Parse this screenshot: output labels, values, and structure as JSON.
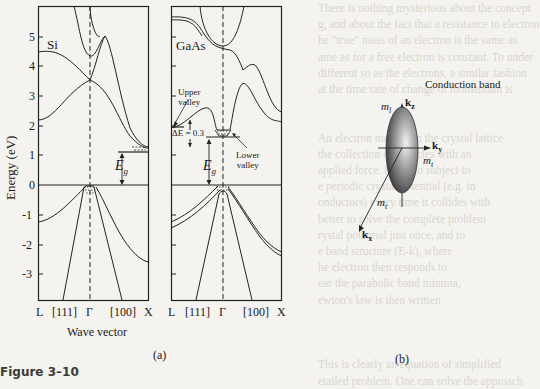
{
  "figure": {
    "caption": "Figure 3–10",
    "panel_a_label": "(a)",
    "panel_b_label": "(b)"
  },
  "panel_a": {
    "y_axis_label": "Energy (eV)",
    "x_axis_label": "Wave vector",
    "y_ticks": [
      "5",
      "4",
      "3",
      "2",
      "1",
      "0",
      "-1",
      "-2",
      "-3"
    ],
    "si": {
      "title": "Si",
      "x_ticks": [
        "L",
        "[111]",
        "Γ",
        "[100]",
        "X"
      ],
      "gap_label": "E",
      "gap_sub": "g"
    },
    "gaas": {
      "title": "GaAs",
      "x_ticks": [
        "L",
        "[111]",
        "Γ",
        "[100]",
        "X"
      ],
      "upper_valley": [
        "Upper",
        "valley"
      ],
      "lower_valley": [
        "Lower",
        "valley"
      ],
      "delta_e": "ΔE = 0.3",
      "gap_label": "E",
      "gap_sub": "g"
    }
  },
  "panel_b": {
    "title": "Conduction band",
    "axes": {
      "kz": "k",
      "kz_sub": "z",
      "ky": "k",
      "ky_sub": "y",
      "kx": "k",
      "kx_sub": "x"
    },
    "mass_labels": {
      "longitudinal": "m",
      "longitudinal_sub": "l",
      "transverse": "m",
      "transverse_sub": "t"
    }
  },
  "background_text": [
    "There is nothing mysterious about the concept",
    "g, and about the fact that a resistance to electron",
    "he \"true\" mass of an electron is the same as",
    "ame as for a free electron is constant. To under",
    "different so as the electrons, a similar fashion",
    "at the time rate of change of momentum is",
    "",
    "",
    "An electron moving in the crystal lattice",
    "the collection of particles with an",
    "applied force. It is also subject to",
    "e periodic crystal potential (e.g. in",
    "onductors) every time it collides with",
    "better to solve the complete problem",
    "rystal potential just once, and to",
    "e band structure (E-k), where",
    "he electron then responds to",
    "ear the parabolic band minima,",
    "ewton's law is then written",
    "",
    "",
    "",
    "This is clearly an equation of simplified",
    "etailed problem. One can solve the approach"
  ],
  "chart_data": {
    "type": "line",
    "xlabel": "Wave vector",
    "ylabel": "Energy (eV)",
    "ylim": [
      -4,
      6
    ],
    "y_ticks": [
      -3,
      -2,
      -1,
      0,
      1,
      2,
      3,
      4,
      5
    ],
    "panels": [
      {
        "name": "Si",
        "x_ticks": [
          "L",
          "[111]",
          "Γ",
          "[100]",
          "X"
        ],
        "band_gap_eV": 1.1,
        "gap_type": "indirect",
        "conduction_minimum": "near X along [100]",
        "bands": [
          {
            "name": "upper conduction",
            "points": [
              [
                0.35,
                6.2
              ],
              [
                0.5,
                5.2
              ],
              [
                0.55,
                4.35
              ],
              [
                0.62,
                4.5
              ],
              [
                0.72,
                5.0
              ],
              [
                0.8,
                4.0
              ],
              [
                1.0,
                1.15
              ]
            ]
          },
          {
            "name": "conduction (L)",
            "points": [
              [
                0,
                4.5
              ],
              [
                0.2,
                4.5
              ],
              [
                0.55,
                3.5
              ],
              [
                0.7,
                5.0
              ]
            ]
          },
          {
            "name": "lower conduction",
            "points": [
              [
                0,
                2.2
              ],
              [
                0.25,
                2.5
              ],
              [
                0.5,
                3.5
              ],
              [
                0.65,
                3.3
              ],
              [
                0.85,
                1.8
              ],
              [
                1.0,
                1.2
              ]
            ]
          },
          {
            "name": "heavy hole",
            "points": [
              [
                0,
                -1.2
              ],
              [
                0.3,
                -0.5
              ],
              [
                0.5,
                0
              ]
            ]
          },
          {
            "name": "light hole",
            "points": [
              [
                0.23,
                -4
              ],
              [
                0.48,
                0
              ]
            ]
          },
          {
            "name": "valence [100]",
            "points": [
              [
                0.52,
                0
              ],
              [
                0.75,
                -1.5
              ],
              [
                1.0,
                -2.9
              ]
            ]
          },
          {
            "name": "valence [100] steep",
            "points": [
              [
                0.55,
                0
              ],
              [
                0.8,
                -4
              ]
            ]
          }
        ]
      },
      {
        "name": "GaAs",
        "x_ticks": [
          "L",
          "[111]",
          "Γ",
          "[100]",
          "X"
        ],
        "band_gap_eV": 1.43,
        "gap_type": "direct",
        "delta_E_upper_lower_valley_eV": 0.3,
        "annotations": [
          "Upper valley",
          "Lower valley",
          "ΔE = 0.3",
          "Eg"
        ],
        "bands": [
          {
            "name": "upper conduction pair",
            "points": [
              [
                0,
                5.6
              ],
              [
                0.3,
                5.5
              ],
              [
                0.55,
                4.7
              ],
              [
                0.7,
                4.5
              ],
              [
                0.85,
                3.9
              ],
              [
                1.0,
                3.6
              ]
            ]
          },
          {
            "name": "upper conduction Γ",
            "points": [
              [
                0.4,
                6.2
              ],
              [
                0.55,
                4.7
              ],
              [
                0.7,
                6.2
              ]
            ]
          },
          {
            "name": "conduction",
            "points": [
              [
                0,
                1.9
              ],
              [
                0.3,
                2.6
              ],
              [
                0.45,
                1.9
              ],
              [
                0.55,
                1.55
              ],
              [
                0.65,
                2.0
              ],
              [
                0.75,
                3.5
              ],
              [
                0.85,
                2.5
              ],
              [
                1.0,
                1.9
              ]
            ]
          },
          {
            "name": "valence L pair",
            "points": [
              [
                0,
                -1.3
              ],
              [
                0.25,
                -0.6
              ],
              [
                0.5,
                0
              ]
            ]
          },
          {
            "name": "light hole",
            "points": [
              [
                0.22,
                -4
              ],
              [
                0.5,
                -0.3
              ],
              [
                0.52,
                -0.3
              ],
              [
                0.8,
                -4
              ]
            ]
          },
          {
            "name": "valence [100] pair",
            "points": [
              [
                0.55,
                0
              ],
              [
                0.8,
                -1.5
              ],
              [
                1.0,
                -2.0
              ]
            ]
          }
        ]
      }
    ]
  }
}
